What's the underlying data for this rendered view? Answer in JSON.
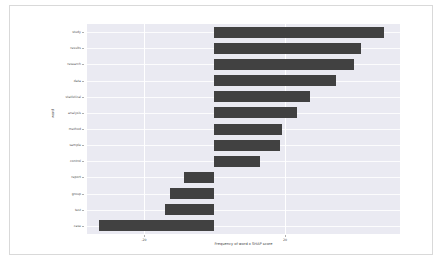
{
  "chart_data": {
    "type": "bar",
    "orientation": "horizontal",
    "title": "",
    "xlabel": "Frequency of word x SHAP score",
    "ylabel": "word",
    "categories": [
      "study",
      "results",
      "research",
      "data",
      "statistical",
      "analysis",
      "method",
      "sample",
      "control",
      "report",
      "group",
      "test",
      "case"
    ],
    "values": [
      48.0,
      41.5,
      39.5,
      34.5,
      27.0,
      23.5,
      19.0,
      18.5,
      13.0,
      -8.5,
      -12.5,
      -14.0,
      -32.5
    ],
    "xlim": [
      -36.0,
      52.5
    ],
    "xticks": [
      -20,
      20
    ],
    "xticklabels": [
      "-20",
      "20"
    ],
    "grid": true,
    "grid_axis": "both",
    "legend": null,
    "bar_color": "#414141",
    "axes_facecolor": "#eaeaf2",
    "grid_color": "#ffffff",
    "figure_facecolor": "#ffffff"
  },
  "figure": {
    "frame_color": "#d9d9d9"
  }
}
